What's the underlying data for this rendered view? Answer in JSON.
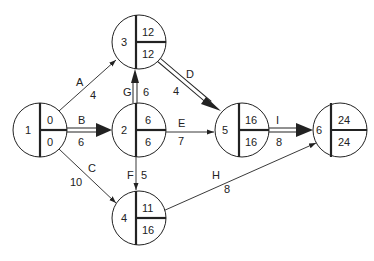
{
  "diagram": {
    "type": "activity-on-arrow network (CPM)",
    "nodes": [
      {
        "id": "1",
        "label": "1",
        "x": 40,
        "y": 130,
        "early": "0",
        "late": "0"
      },
      {
        "id": "2",
        "label": "2",
        "x": 139,
        "y": 130,
        "early": "6",
        "late": "6"
      },
      {
        "id": "3",
        "label": "3",
        "x": 139,
        "y": 42,
        "early": "12",
        "late": "12"
      },
      {
        "id": "4",
        "label": "4",
        "x": 139,
        "y": 218,
        "early": "11",
        "late": "16"
      },
      {
        "id": "5",
        "label": "5",
        "x": 242,
        "y": 130,
        "early": "16",
        "late": "16"
      },
      {
        "id": "6",
        "label": "6",
        "x": 340,
        "y": 130,
        "early": "24",
        "late": "24"
      }
    ],
    "activities": [
      {
        "name": "A",
        "duration": "4",
        "from": "1",
        "to": "3",
        "critical": false
      },
      {
        "name": "B",
        "duration": "6",
        "from": "1",
        "to": "2",
        "critical": true
      },
      {
        "name": "C",
        "duration": "10",
        "from": "1",
        "to": "4",
        "critical": false
      },
      {
        "name": "G",
        "duration": "6",
        "from": "2",
        "to": "3",
        "critical": true
      },
      {
        "name": "D",
        "duration": "4",
        "from": "3",
        "to": "5",
        "critical": true
      },
      {
        "name": "E",
        "duration": "7",
        "from": "2",
        "to": "5",
        "critical": false
      },
      {
        "name": "F",
        "duration": "5",
        "from": "2",
        "to": "4",
        "critical": false
      },
      {
        "name": "H",
        "duration": "8",
        "from": "4",
        "to": "6",
        "critical": false
      },
      {
        "name": "I",
        "duration": "8",
        "from": "5",
        "to": "6",
        "critical": true
      }
    ]
  }
}
